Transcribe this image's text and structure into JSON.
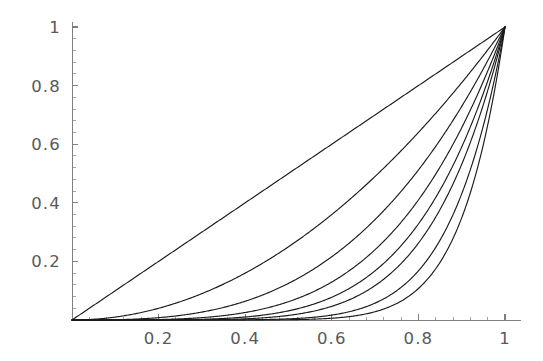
{
  "figure": {
    "title": "",
    "background_color": "#ffffff",
    "axis_color": "#808080",
    "curve_color": "#1b1b1b",
    "label_color": "#595959"
  },
  "chart_data": {
    "type": "line",
    "title": "",
    "subtitle": "",
    "xlabel": "",
    "ylabel": "",
    "xlim": [
      0,
      1
    ],
    "ylim": [
      0,
      1
    ],
    "grid": false,
    "legend": false,
    "legend_position": "none",
    "x_ticks": [
      {
        "value": 0.2,
        "label": "0.2"
      },
      {
        "value": 0.4,
        "label": "0.4"
      },
      {
        "value": 0.6,
        "label": "0.6"
      },
      {
        "value": 0.8,
        "label": "0.8"
      },
      {
        "value": 1.0,
        "label": "1"
      }
    ],
    "y_ticks": [
      {
        "value": 0.2,
        "label": "0.2"
      },
      {
        "value": 0.4,
        "label": "0.4"
      },
      {
        "value": 0.6,
        "label": "0.6"
      },
      {
        "value": 0.8,
        "label": "0.8"
      },
      {
        "value": 1.0,
        "label": "1"
      }
    ],
    "x_minor_ticks_per_interval": 4,
    "y_minor_ticks_per_interval": 4,
    "annotations": [],
    "x": [
      0,
      0.05,
      0.1,
      0.15,
      0.2,
      0.25,
      0.3,
      0.35,
      0.4,
      0.45,
      0.5,
      0.55,
      0.6,
      0.65,
      0.7,
      0.75,
      0.8,
      0.85,
      0.9,
      0.95,
      1
    ],
    "series": [
      {
        "name": "n = 1",
        "exponent": 1,
        "values": [
          0,
          0.05,
          0.1,
          0.15,
          0.2,
          0.25,
          0.3,
          0.35,
          0.4,
          0.45,
          0.5,
          0.55,
          0.6,
          0.65,
          0.7,
          0.75,
          0.8,
          0.85,
          0.9,
          0.95,
          1
        ]
      },
      {
        "name": "n = 2",
        "exponent": 2,
        "values": [
          0,
          0.0025,
          0.01,
          0.0225,
          0.04,
          0.0625,
          0.09,
          0.1225,
          0.16,
          0.2025,
          0.25,
          0.3025,
          0.36,
          0.4225,
          0.49,
          0.5625,
          0.64,
          0.7225,
          0.81,
          0.9025,
          1
        ]
      },
      {
        "name": "n = 3",
        "exponent": 3,
        "values": [
          0,
          0.000125,
          0.001,
          0.003375,
          0.008,
          0.015625,
          0.027,
          0.042875,
          0.064,
          0.091125,
          0.125,
          0.166375,
          0.216,
          0.274625,
          0.343,
          0.421875,
          0.512,
          0.614125,
          0.729,
          0.857375,
          1
        ]
      },
      {
        "name": "n = 4",
        "exponent": 4,
        "values": [
          0,
          6.25e-06,
          0.0001,
          0.00050625,
          0.0016,
          0.00390625,
          0.0081,
          0.01500625,
          0.0256,
          0.04100625,
          0.0625,
          0.09150625,
          0.1296,
          0.17850625,
          0.2401,
          0.31640625,
          0.4096,
          0.52200625,
          0.6561,
          0.81450625,
          1
        ]
      },
      {
        "name": "n = 5",
        "exponent": 5,
        "values": [
          0,
          3e-07,
          1e-05,
          7.59e-05,
          0.00032,
          0.0009766,
          0.00243,
          0.0052522,
          0.01024,
          0.0184528,
          0.03125,
          0.0503284,
          0.07776,
          0.1160291,
          0.16807,
          0.2373047,
          0.32768,
          0.4437053,
          0.59049,
          0.7737809,
          1
        ]
      },
      {
        "name": "n = 6",
        "exponent": 6,
        "values": [
          0,
          1.56e-08,
          1e-06,
          1.14e-05,
          6.4e-05,
          0.0002441,
          0.000729,
          0.0018383,
          0.004096,
          0.0083038,
          0.015625,
          0.0276806,
          0.046656,
          0.0754189,
          0.117649,
          0.1779785,
          0.262144,
          0.3771495,
          0.531441,
          0.7350919,
          1
        ]
      },
      {
        "name": "n = 8",
        "exponent": 8,
        "values": [
          0,
          3.91e-11,
          1e-08,
          2.6e-07,
          2.56e-06,
          1.53e-05,
          6.56e-05,
          0.0002252,
          0.00065536,
          0.0016815,
          0.00390625,
          0.0083733,
          0.01679616,
          0.0318644,
          0.05764801,
          0.1001129,
          0.16777216,
          0.2724905,
          0.43046721,
          0.6634204,
          1
        ]
      },
      {
        "name": "n = 10",
        "exponent": 10,
        "values": [
          0,
          1e-13,
          1e-10,
          5.8e-09,
          1.024e-07,
          9.5e-07,
          5.9e-06,
          2.76e-05,
          0.0001049,
          0.000341,
          0.0009766,
          0.0025329,
          0.0060466,
          0.0134591,
          0.0282475,
          0.0563135,
          0.1073742,
          0.1968744,
          0.3486784,
          0.5987369,
          1
        ]
      }
    ]
  }
}
